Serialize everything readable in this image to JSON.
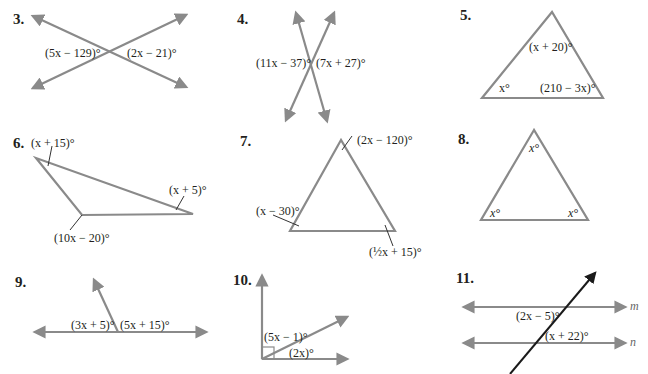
{
  "problems": [
    {
      "number": "3.",
      "type": "vertical-angles",
      "labels": [
        "(5x − 129)°",
        "(2x − 21)°"
      ]
    },
    {
      "number": "4.",
      "type": "vertical-angles",
      "labels": [
        "(11x − 37)°",
        "(7x + 27)°"
      ]
    },
    {
      "number": "5.",
      "type": "triangle",
      "labels": [
        "(x + 20)°",
        "x°",
        "(210 − 3x)°"
      ]
    },
    {
      "number": "6.",
      "type": "triangle",
      "labels": [
        "(x + 15)°",
        "(x + 5)°",
        "(10x − 20)°"
      ]
    },
    {
      "number": "7.",
      "type": "triangle",
      "labels": [
        "(2x − 120)°",
        "(x − 30)°",
        "(½x + 15)°"
      ]
    },
    {
      "number": "8.",
      "type": "triangle",
      "labels": [
        "x°",
        "x°",
        "x°"
      ]
    },
    {
      "number": "9.",
      "type": "linear-pair",
      "labels": [
        "(3x + 5)°",
        "(5x + 15)°"
      ]
    },
    {
      "number": "10.",
      "type": "complementary",
      "labels": [
        "(5x − 1)°",
        "(2x)°"
      ]
    },
    {
      "number": "11.",
      "type": "parallel-lines-transversal",
      "labels": [
        "(2x − 5)°",
        "(x + 22)°"
      ],
      "line_names": [
        "m",
        "n"
      ]
    }
  ],
  "colors": {
    "line": "#8a8a8a",
    "transversal": "#1a1a1a",
    "text": "#231f20"
  }
}
